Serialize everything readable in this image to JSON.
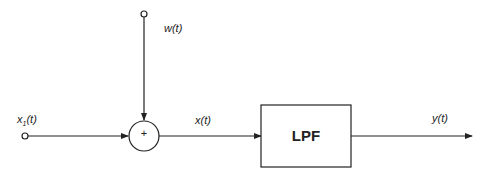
{
  "diagram": {
    "type": "block-diagram",
    "nodes": [
      {
        "id": "input",
        "label": "x1(t)",
        "kind": "terminal"
      },
      {
        "id": "noise",
        "label": "w(t)",
        "kind": "terminal"
      },
      {
        "id": "sum",
        "label": "+",
        "kind": "summing-junction"
      },
      {
        "id": "lpf",
        "label": "LPF",
        "kind": "block"
      },
      {
        "id": "output",
        "label": "y(t)",
        "kind": "output-arrow"
      }
    ],
    "edges": [
      {
        "from": "input",
        "to": "sum"
      },
      {
        "from": "noise",
        "to": "sum"
      },
      {
        "from": "sum",
        "to": "lpf",
        "label": "x(t)"
      },
      {
        "from": "lpf",
        "to": "output",
        "label": "y(t)"
      }
    ]
  },
  "labels": {
    "x1_main": "x",
    "x1_sub": "1",
    "x1_rest": "(t)",
    "w": "w(t)",
    "x": "x(t)",
    "y": "y(t)",
    "sum": "+",
    "lpf": "LPF"
  }
}
